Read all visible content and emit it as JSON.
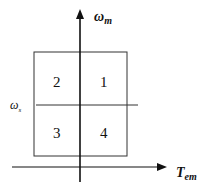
{
  "diagram": {
    "type": "four-quadrant operating diagram",
    "axes": {
      "vertical": {
        "symbol": "ω",
        "subscript": "m"
      },
      "horizontal": {
        "symbol": "T",
        "subscript": "em"
      }
    },
    "reference_line": {
      "symbol": "ω",
      "subscript": "s"
    },
    "quadrants": [
      {
        "label": "1",
        "position": "upper-right"
      },
      {
        "label": "2",
        "position": "upper-left"
      },
      {
        "label": "3",
        "position": "lower-left"
      },
      {
        "label": "4",
        "position": "lower-right"
      }
    ],
    "colors": {
      "line": "#222222",
      "background": "#ffffff"
    }
  }
}
